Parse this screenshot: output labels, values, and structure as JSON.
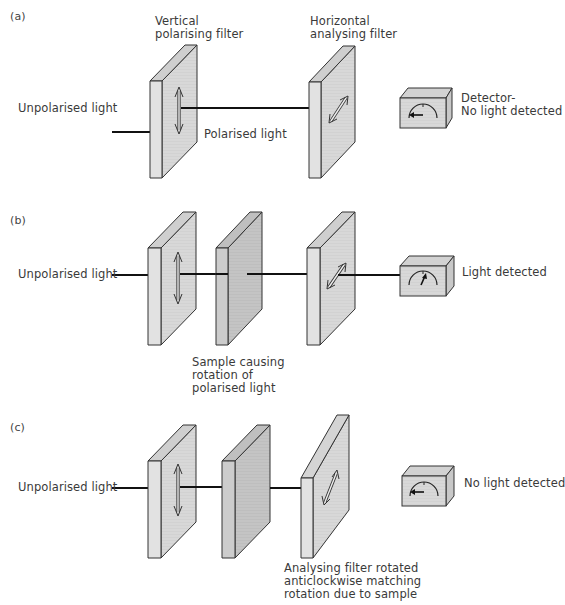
{
  "diagram": {
    "colors": {
      "filter_face": "#d6d6d6",
      "filter_side": "#e3e3e3",
      "filter_top": "#cfcfcf",
      "sample_face": "#c2c2c2",
      "sample_side": "#d0d0d0",
      "outline": "#333333",
      "light_beam": "#111111"
    },
    "panels": [
      {
        "id": "a",
        "label": "(a)",
        "source_label": "Unpolarised light",
        "polariser_label": "Vertical\npolarising filter",
        "polarised_label": "Polarised light",
        "analyser_label": "Horizontal\nanalysing filter",
        "detector_label": "Detector-\nNo light detected",
        "detector_state": "no light"
      },
      {
        "id": "b",
        "label": "(b)",
        "source_label": "Unpolarised light",
        "sample_label": "Sample causing\nrotation of\npolarised light",
        "detector_label": "Light detected",
        "detector_state": "light"
      },
      {
        "id": "c",
        "label": "(c)",
        "source_label": "Unpolarised light",
        "analyser_label": "Analysing filter rotated\nanticlockwise matching\nrotation due to sample",
        "detector_label": "No light detected",
        "detector_state": "no light"
      }
    ]
  }
}
